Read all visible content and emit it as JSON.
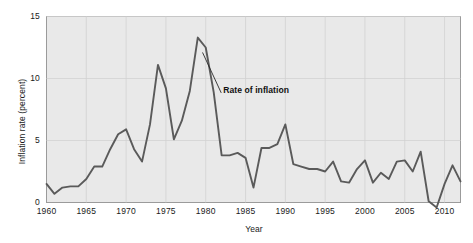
{
  "chart_data": {
    "type": "line",
    "title": "",
    "xlabel": "Year",
    "ylabel": "Inflation rate (percent)",
    "xlim": [
      1960,
      2012
    ],
    "ylim": [
      0,
      15
    ],
    "yticks": [
      0,
      5,
      10,
      15
    ],
    "ytick_labels": [
      "0",
      "5",
      "10",
      "15"
    ],
    "xticks": [
      1960,
      1965,
      1970,
      1975,
      1980,
      1985,
      1990,
      1995,
      2000,
      2005,
      2010
    ],
    "xtick_labels": [
      "1960",
      "1965",
      "1970",
      "1975",
      "1980",
      "1985",
      "1990",
      "1995",
      "2000",
      "2005",
      "2010"
    ],
    "grid": true,
    "legend_position": "none",
    "annotations": [
      {
        "text": "Rate of inflation",
        "x": 1982.2,
        "y": 9.0
      }
    ],
    "series": [
      {
        "name": "Rate of inflation",
        "color": "#5a5a5a",
        "x": [
          1960,
          1961,
          1962,
          1963,
          1964,
          1965,
          1966,
          1967,
          1968,
          1969,
          1970,
          1971,
          1972,
          1973,
          1974,
          1975,
          1976,
          1977,
          1978,
          1979,
          1980,
          1981,
          1982,
          1983,
          1984,
          1985,
          1986,
          1987,
          1988,
          1989,
          1990,
          1991,
          1992,
          1993,
          1994,
          1995,
          1996,
          1997,
          1998,
          1999,
          2000,
          2001,
          2002,
          2003,
          2004,
          2005,
          2006,
          2007,
          2008,
          2009,
          2010,
          2011,
          2012
        ],
        "values": [
          1.5,
          0.7,
          1.2,
          1.3,
          1.3,
          1.9,
          2.9,
          2.9,
          4.3,
          5.5,
          5.9,
          4.3,
          3.3,
          6.3,
          11.1,
          9.2,
          5.1,
          6.6,
          9.0,
          13.3,
          12.5,
          8.9,
          3.8,
          3.8,
          4.0,
          3.6,
          1.2,
          4.4,
          4.4,
          4.7,
          6.3,
          3.1,
          2.9,
          2.7,
          2.7,
          2.5,
          3.3,
          1.7,
          1.6,
          2.7,
          3.4,
          1.6,
          2.4,
          1.9,
          3.3,
          3.4,
          2.5,
          4.1,
          0.1,
          -0.4,
          1.5,
          3.0,
          1.7
        ]
      }
    ]
  }
}
